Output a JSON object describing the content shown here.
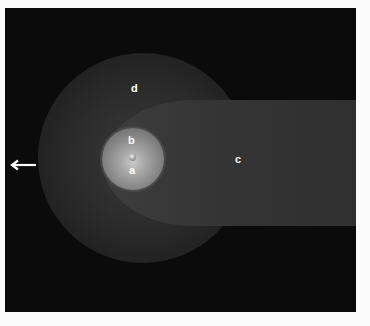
{
  "diagram": {
    "labels": {
      "a": "a",
      "b": "b",
      "c": "c",
      "d": "d"
    },
    "regions": [
      {
        "key": "a",
        "description": "nucleus"
      },
      {
        "key": "b",
        "description": "coma"
      },
      {
        "key": "c",
        "description": "tail"
      },
      {
        "key": "d",
        "description": "hydrogen envelope"
      }
    ],
    "arrow": {
      "direction": "left",
      "color": "#ffffff"
    },
    "colors": {
      "background": "#0b0b0b",
      "page": "#fbfbfb",
      "halo": "#2c2c2c",
      "tail": "#383838",
      "coma": "#a8a8a8",
      "label": "#ffffff"
    }
  }
}
